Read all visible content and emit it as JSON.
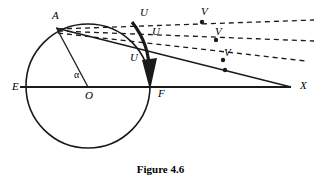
{
  "figure": {
    "caption": "Figure 4.6",
    "stroke_color": "#1a1a1a",
    "background_color": "#ffffff"
  },
  "labels": {
    "point_a": "A",
    "point_e": "E",
    "point_o": "O",
    "point_f": "F",
    "point_x": "X",
    "angle_alpha": "α",
    "u_top": "U",
    "u_middle": "U",
    "u_bottom": "U",
    "v_top": "V",
    "v_middle": "V",
    "v_bottom": "V"
  },
  "geometry": {
    "circle": {
      "cx": 88,
      "cy": 86,
      "r": 62
    },
    "points": {
      "A": {
        "x": 57,
        "y": 28
      },
      "E": {
        "x": 26,
        "y": 87
      },
      "O": {
        "x": 88,
        "y": 87
      },
      "F": {
        "x": 150,
        "y": 87
      },
      "X": {
        "x": 291,
        "y": 87
      }
    },
    "dashed_rays": [
      {
        "name": "ray-u-top-v-top",
        "x1": 58,
        "y1": 29,
        "x2": 312,
        "y2": 21
      },
      {
        "name": "ray-u-middle-v-middle",
        "x1": 58,
        "y1": 31,
        "x2": 312,
        "y2": 40
      },
      {
        "name": "ray-u-bottom-v-bottom",
        "x1": 58,
        "y1": 33,
        "x2": 305,
        "y2": 60
      }
    ],
    "solid_ray": {
      "name": "ray-a-x",
      "x1": 57,
      "y1": 29,
      "x2": 291,
      "y2": 87
    },
    "radius_segment": {
      "name": "segment-o-a",
      "x1": 88,
      "y1": 87,
      "x2": 57,
      "y2": 29
    },
    "dots": [
      {
        "name": "dot-v-top",
        "x": 202,
        "y": 22
      },
      {
        "name": "dot-v-middle",
        "x": 215,
        "y": 40
      },
      {
        "name": "dot-v-bottom",
        "x": 222,
        "y": 60
      },
      {
        "name": "dot-on-ax",
        "x": 224,
        "y": 62
      }
    ],
    "arrow": {
      "name": "arc-arrow-to-f",
      "tip_x": 150,
      "tip_y": 88
    }
  }
}
